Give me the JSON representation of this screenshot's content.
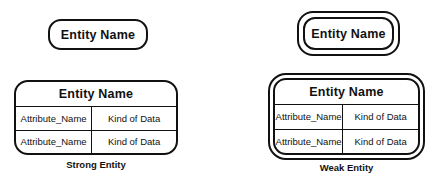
{
  "diagram": {
    "background_color": "#ffffff",
    "stroke_color": "#111111"
  },
  "strong_entity": {
    "caption": "Strong Entity",
    "name_box": {
      "label": "Entity Name",
      "border_style": "single",
      "shape": "rounded-rectangle"
    },
    "table": {
      "border_style": "single",
      "header": "Entity Name",
      "columns": [
        "Attribute",
        "Data Type"
      ],
      "rows": [
        {
          "attribute": "Attribute_Name",
          "kind": "Kind of Data"
        },
        {
          "attribute": "Attribute_Name",
          "kind": "Kind of Data"
        }
      ]
    }
  },
  "weak_entity": {
    "caption": "Weak Entity",
    "name_box": {
      "label": "Entity Name",
      "border_style": "double",
      "shape": "rounded-rectangle"
    },
    "table": {
      "border_style": "double",
      "header": "Entity Name",
      "columns": [
        "Attribute",
        "Data Type"
      ],
      "rows": [
        {
          "attribute": "Attribute_Name",
          "kind": "Kind of Data"
        },
        {
          "attribute": "Attribute_Name",
          "kind": "Kind of Data"
        }
      ]
    }
  }
}
